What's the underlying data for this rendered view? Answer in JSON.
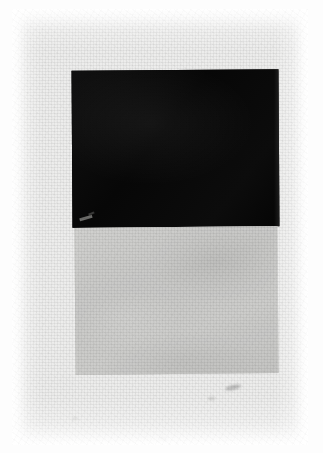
{
  "image": {
    "kind": "photographic-reproduction-of-painting",
    "medium": "oil on canvas",
    "style": "Suprematism",
    "orientation": "portrait",
    "width_px": 323,
    "height_px": 453,
    "description": "A monochrome photograph of a suprematist painting: a solid black quadrilateral resting directly above a pale grey quadrilateral on a coarse, light woven canvas ground."
  },
  "support": {
    "name": "canvas-ground",
    "color": "#ededec",
    "texture": "woven-linen-weave",
    "margin_color": "#fdfdfd"
  },
  "shapes": [
    {
      "name": "black-quadrilateral",
      "label": "Black square",
      "color": "#0a0a0a",
      "x": 60,
      "y": 61,
      "width": 207,
      "height": 157,
      "rotation_deg": -0.35
    },
    {
      "name": "grey-quadrilateral",
      "label": "Grey square",
      "color": "#c9c9c7",
      "x": 63,
      "y": 218,
      "width": 203,
      "height": 147,
      "rotation_deg": -0.5
    }
  ],
  "surface_marks": [
    {
      "name": "paint-abrasion",
      "location": "lower-left of black quadrilateral",
      "color": "#bebeb9"
    },
    {
      "name": "canvas-smudge",
      "location": "below grey quadrilateral, right of centre",
      "color": "#787876"
    },
    {
      "name": "canvas-speck",
      "location": "lower margin",
      "color": "#9b9b98"
    }
  ],
  "palette": {
    "black": "#0a0a0a",
    "grey": "#c9c9c7",
    "canvas": "#ededec",
    "paper": "#fdfdfd"
  }
}
